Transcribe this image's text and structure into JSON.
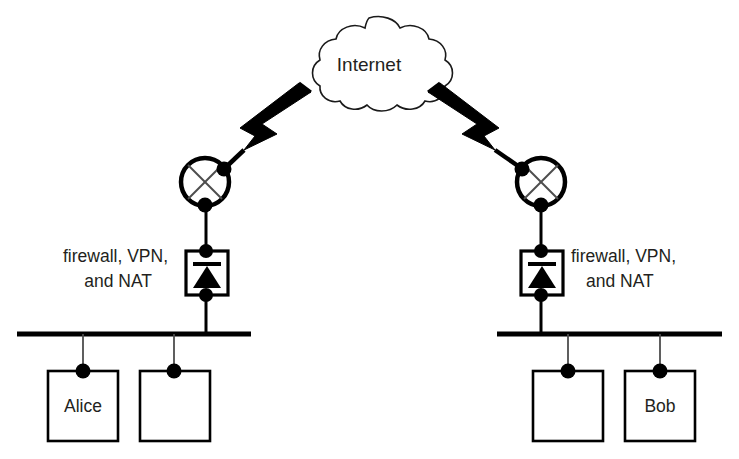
{
  "diagram": {
    "cloud": {
      "label": "Internet",
      "name": "internet-cloud"
    },
    "left_site": {
      "gateway_label_line1": "firewall, VPN,",
      "gateway_label_line2": "and NAT",
      "router_name": "router-left",
      "firewall_name": "firewall-left",
      "bus_name": "lan-bus-left",
      "hosts": [
        {
          "label": "Alice",
          "name": "host-alice"
        },
        {
          "label": "",
          "name": "host-left-unlabeled"
        }
      ]
    },
    "right_site": {
      "gateway_label_line1": "firewall, VPN,",
      "gateway_label_line2": "and NAT",
      "router_name": "router-right",
      "firewall_name": "firewall-right",
      "bus_name": "lan-bus-right",
      "hosts": [
        {
          "label": "",
          "name": "host-right-unlabeled"
        },
        {
          "label": "Bob",
          "name": "host-bob"
        }
      ]
    },
    "links": {
      "left_wan_name": "wireless-link-left",
      "right_wan_name": "wireless-link-right"
    },
    "colors": {
      "stroke": "#000000",
      "text": "#231f20",
      "background": "#ffffff",
      "thin_stroke": "#1a1a1a"
    }
  }
}
